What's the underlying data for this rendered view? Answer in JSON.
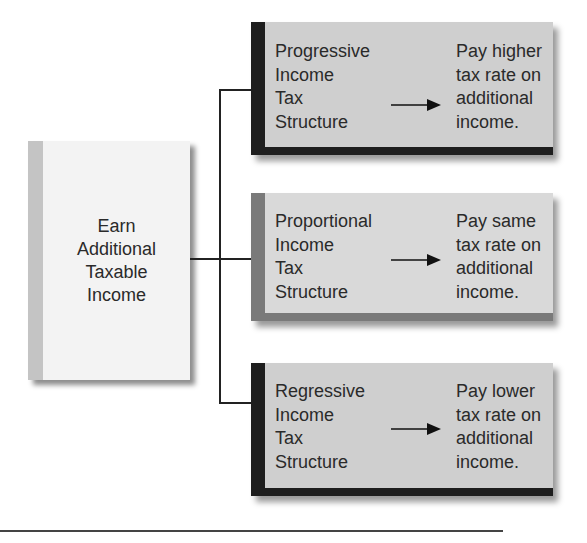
{
  "source": {
    "text": "Earn\nAdditional\nTaxable\nIncome"
  },
  "branches": [
    {
      "label": "Progressive\nIncome\nTax\nStructure",
      "result": "Pay higher\ntax rate on\nadditional\nincome.",
      "stripe_color": "#1e1e1e"
    },
    {
      "label": "Proportional\nIncome\nTax\nStructure",
      "result": "Pay same\ntax rate on\nadditional\nincome.",
      "stripe_color": "#7a7a7a"
    },
    {
      "label": "Regressive\nIncome\nTax\nStructure",
      "result": "Pay lower\ntax rate on\nadditional\nincome.",
      "stripe_color": "#1e1e1e"
    }
  ],
  "icons": {
    "arrow": "right-arrow-icon"
  }
}
